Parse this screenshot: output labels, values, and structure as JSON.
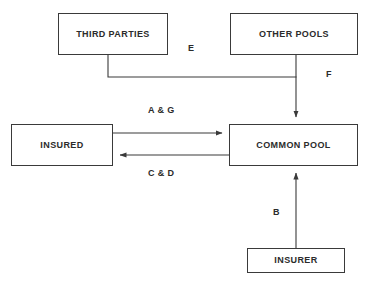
{
  "diagram": {
    "type": "flow-diagram",
    "background_color": "#ffffff",
    "line_color": "#3a3a3a",
    "text_color": "#2b2b2b",
    "nodes": [
      {
        "id": "third-parties",
        "label": "THIRD PARTIES",
        "x": 58,
        "y": 13,
        "width": 110,
        "height": 42
      },
      {
        "id": "other-pools",
        "label": "OTHER POOLS",
        "x": 230,
        "y": 13,
        "width": 128,
        "height": 42
      },
      {
        "id": "insured",
        "label": "INSURED",
        "x": 11,
        "y": 124,
        "width": 102,
        "height": 42
      },
      {
        "id": "common-pool",
        "label": "COMMON POOL",
        "x": 229,
        "y": 124,
        "width": 129,
        "height": 42
      },
      {
        "id": "insurer",
        "label": "INSURER",
        "x": 247,
        "y": 248,
        "width": 98,
        "height": 25
      }
    ],
    "edges": [
      {
        "id": "edge-e",
        "label": "E",
        "from": "third-parties",
        "to": "common-pool",
        "label_x": 188,
        "label_y": 44
      },
      {
        "id": "edge-f",
        "label": "F",
        "from": "other-pools",
        "to": "common-pool",
        "label_x": 326,
        "label_y": 70
      },
      {
        "id": "edge-a-g",
        "label": "A & G",
        "from": "insured",
        "to": "common-pool",
        "label_x": 148,
        "label_y": 106
      },
      {
        "id": "edge-c-d",
        "label": "C & D",
        "from": "common-pool",
        "to": "insured",
        "label_x": 148,
        "label_y": 169
      },
      {
        "id": "edge-b",
        "label": "B",
        "from": "insurer",
        "to": "common-pool",
        "label_x": 273,
        "label_y": 208
      }
    ]
  }
}
